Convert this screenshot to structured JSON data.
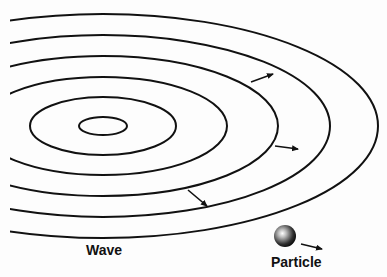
{
  "labels": {
    "wave": "Wave",
    "particle": "Particle"
  },
  "colors": {
    "stroke": "#111111",
    "background": "#fdfdfd"
  },
  "wave": {
    "center": [
      103,
      126
    ],
    "rings": [
      {
        "rx": 24,
        "ry": 9
      },
      {
        "rx": 73,
        "ry": 29
      },
      {
        "rx": 124,
        "ry": 49
      },
      {
        "rx": 175,
        "ry": 70
      },
      {
        "rx": 227,
        "ry": 91
      },
      {
        "rx": 275,
        "ry": 112
      }
    ],
    "arrows": [
      {
        "from": [
          251,
          82
        ],
        "to": [
          273,
          74
        ]
      },
      {
        "from": [
          275,
          146
        ],
        "to": [
          298,
          149
        ]
      },
      {
        "from": [
          188,
          190
        ],
        "to": [
          207,
          206
        ]
      }
    ]
  },
  "particle": {
    "center": [
      285,
      236
    ],
    "radius": 11,
    "arrow": {
      "from": [
        301,
        244
      ],
      "to": [
        322,
        249
      ]
    }
  }
}
